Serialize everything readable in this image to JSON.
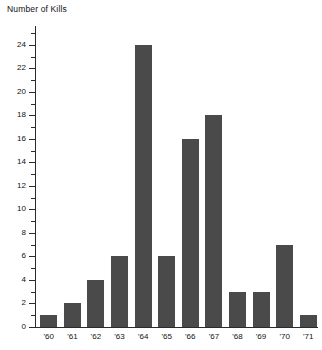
{
  "chart_data": {
    "type": "bar",
    "title": "Number of Kills",
    "ylabel": "Number of Kills",
    "xlabel": "",
    "categories": [
      "'60",
      "'61",
      "'62",
      "'63",
      "'64",
      "'65",
      "'66",
      "'67",
      "'68",
      "'69",
      "'70",
      "'71"
    ],
    "values": [
      1,
      2,
      4,
      6,
      24,
      6,
      16,
      18,
      3,
      3,
      7,
      1
    ],
    "ylim": [
      0,
      25.6
    ],
    "ytick_major": [
      0,
      2,
      4,
      6,
      8,
      10,
      12,
      14,
      16,
      18,
      20,
      22,
      24
    ],
    "ytick_major_labels": [
      "0",
      "2",
      "4",
      "6",
      "8",
      "10",
      "12",
      "14",
      "16",
      "18",
      "20",
      "22",
      "24"
    ],
    "ytick_minor": [
      1,
      3,
      5,
      7,
      9,
      11,
      13,
      15,
      17,
      19,
      21,
      23,
      25
    ],
    "grid": false,
    "legend": "none",
    "bar_color": "#4a4a4a",
    "axis_color": "#2b2b2b",
    "background": "#ffffff"
  }
}
